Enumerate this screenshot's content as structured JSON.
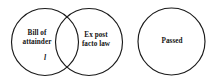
{
  "diagram": {
    "type": "venn",
    "background_color": "#ffffff",
    "stroke_color": "#1a1a1a",
    "text_color": "#141414",
    "sets": [
      {
        "id": "bill-of-attainder",
        "label_line1": "Bill of",
        "label_line2": "attainder",
        "label_full": "Bill of attainder",
        "overlapping": true
      },
      {
        "id": "ex-post-facto-law",
        "label_line1": "Ex post",
        "label_line2": "facto law",
        "label_full": "Ex post facto law",
        "overlapping": true
      },
      {
        "id": "passed",
        "label_line1": "Passed",
        "label_line2": "",
        "label_full": "Passed",
        "overlapping": false
      }
    ],
    "annotations": [
      {
        "id": "region-mark",
        "text": "l",
        "style": "italic"
      }
    ]
  }
}
